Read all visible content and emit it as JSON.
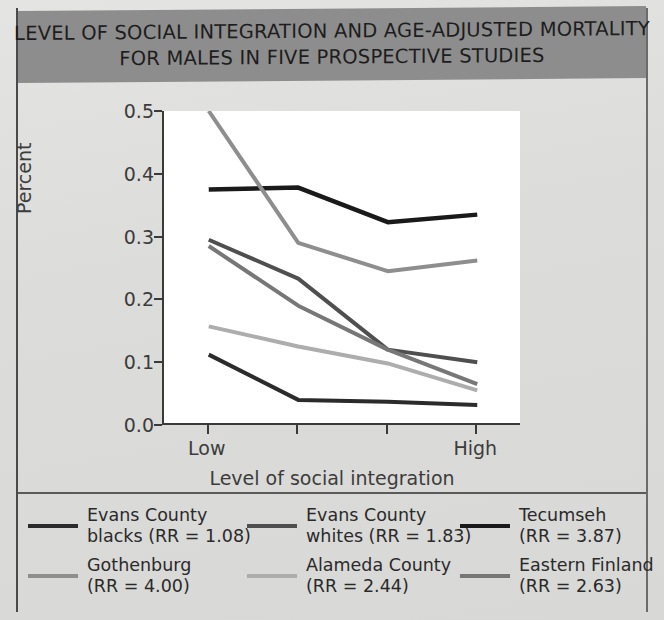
{
  "title": {
    "line1": "LEVEL OF SOCIAL INTEGRATION AND AGE-ADJUSTED MORTALITY",
    "line2": "FOR MALES IN FIVE PROSPECTIVE STUDIES",
    "background_color": "#8d8d8d",
    "text_color": "#1d1d1d"
  },
  "chart_data": {
    "type": "line",
    "title": "LEVEL OF SOCIAL INTEGRATION AND AGE-ADJUSTED MORTALITY FOR MALES IN FIVE PROSPECTIVE STUDIES",
    "xlabel": "Level of social integration",
    "ylabel": "Percent",
    "categories": [
      "Low",
      "",
      "",
      "High"
    ],
    "xtick_labels": [
      "Low",
      "",
      "",
      "High"
    ],
    "ylim": [
      0.0,
      0.5
    ],
    "ytick_labels": [
      "0.0",
      "0.1",
      "0.2",
      "0.3",
      "0.4",
      "0.5"
    ],
    "ytick_values": [
      0.0,
      0.1,
      0.2,
      0.3,
      0.4,
      0.5
    ],
    "grid": false,
    "legend_position": "below",
    "series": [
      {
        "name": "Evans County blacks (RR = 1.08)",
        "label_line1": "Evans County",
        "label_line2": "blacks (RR = 1.08)",
        "rr": "1.08",
        "color": "#2b2b2b",
        "width": 4,
        "values": [
          0.112,
          0.04,
          0.037,
          0.032
        ]
      },
      {
        "name": "Evans County whites (RR = 1.83)",
        "label_line1": "Evans County",
        "label_line2": "whites (RR = 1.83)",
        "rr": "1.83",
        "color": "#4f4f4f",
        "width": 4,
        "values": [
          0.295,
          0.233,
          0.12,
          0.1
        ]
      },
      {
        "name": "Tecumseh (RR = 3.87)",
        "label_line1": "Tecumseh",
        "label_line2": "(RR = 3.87)",
        "rr": "3.87",
        "color": "#1a1a1a",
        "width": 4.5,
        "values": [
          0.375,
          0.378,
          0.323,
          0.335
        ]
      },
      {
        "name": "Gothenburg (RR = 4.00)",
        "label_line1": "Gothenburg",
        "label_line2": "(RR = 4.00)",
        "rr": "4.00",
        "color": "#8e8e8e",
        "width": 4,
        "values": [
          0.5,
          0.29,
          0.245,
          0.262
        ]
      },
      {
        "name": "Alameda County (RR = 2.44)",
        "label_line1": "Alameda County",
        "label_line2": "(RR = 2.44)",
        "rr": "2.44",
        "color": "#adadad",
        "width": 4,
        "values": [
          0.157,
          0.125,
          0.098,
          0.055
        ]
      },
      {
        "name": "Eastern Finland (RR = 2.63)",
        "label_line1": "Eastern Finland",
        "label_line2": "(RR = 2.63)",
        "rr": "2.63",
        "color": "#777777",
        "width": 4,
        "values": [
          0.285,
          0.19,
          0.12,
          0.065
        ]
      }
    ]
  },
  "legend": {
    "rows": [
      [
        {
          "line1": "Evans County",
          "line2": "blacks (RR = 1.08)",
          "color": "#2b2b2b"
        },
        {
          "line1": "Evans County",
          "line2": "whites (RR = 1.83)",
          "color": "#4f4f4f"
        },
        {
          "line1": "Tecumseh",
          "line2": "(RR = 3.87)",
          "color": "#1a1a1a"
        }
      ],
      [
        {
          "line1": "Gothenburg",
          "line2": "(RR = 4.00)",
          "color": "#8e8e8e"
        },
        {
          "line1": "Alameda County",
          "line2": "(RR = 2.44)",
          "color": "#adadad"
        },
        {
          "line1": "Eastern Finland",
          "line2": "(RR = 2.63)",
          "color": "#777777"
        }
      ]
    ]
  }
}
